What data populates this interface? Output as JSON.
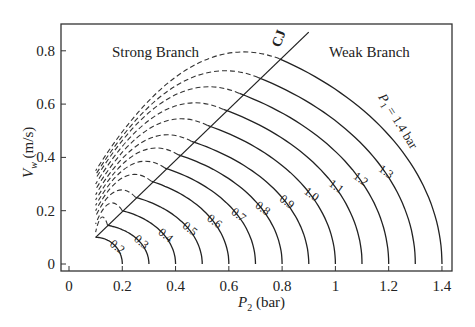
{
  "chart_data": {
    "type": "line",
    "title": "",
    "xlabel": "P2 (bar)",
    "ylabel": "Vw (m/s)",
    "xlim": [
      -0.03,
      1.47
    ],
    "ylim": [
      -0.03,
      0.9
    ],
    "xticks": [
      "0",
      "0.2",
      "0.4",
      "0.6",
      "0.8",
      "1",
      "1.2",
      "1.4"
    ],
    "yticks": [
      "0",
      "0.2",
      "0.4",
      "0.6",
      "0.8"
    ],
    "grid": false,
    "annotations": {
      "strong_branch": "Strong Branch",
      "weak_branch": "Weak Branch",
      "cj_label": "CJ",
      "p1_label": "P1 = 1.4 bar"
    },
    "cj_line": {
      "x": [
        0.1,
        0.9
      ],
      "y": [
        0.1,
        0.87
      ]
    },
    "series": [
      {
        "name": "0.2",
        "p1": 0.2,
        "cj_point": [
          0.1,
          0.1
        ],
        "left_end_y": 0.1
      },
      {
        "name": "0.3",
        "p1": 0.3,
        "cj_point": [
          0.145,
          0.145
        ],
        "left_end_y": 0.12
      },
      {
        "name": "0.4",
        "p1": 0.4,
        "cj_point": [
          0.2,
          0.2
        ],
        "left_end_y": 0.15
      },
      {
        "name": "0.5",
        "p1": 0.5,
        "cj_point": [
          0.25,
          0.25
        ],
        "left_end_y": 0.18
      },
      {
        "name": "0.6",
        "p1": 0.6,
        "cj_point": [
          0.31,
          0.31
        ],
        "left_end_y": 0.2
      },
      {
        "name": "0.7",
        "p1": 0.7,
        "cj_point": [
          0.36,
          0.36
        ],
        "left_end_y": 0.22
      },
      {
        "name": "0.8",
        "p1": 0.8,
        "cj_point": [
          0.41,
          0.41
        ],
        "left_end_y": 0.24
      },
      {
        "name": "0.9",
        "p1": 0.9,
        "cj_point": [
          0.46,
          0.46
        ],
        "left_end_y": 0.26
      },
      {
        "name": "1.0",
        "p1": 1.0,
        "cj_point": [
          0.52,
          0.52
        ],
        "left_end_y": 0.28
      },
      {
        "name": "1.1",
        "p1": 1.1,
        "cj_point": [
          0.58,
          0.58
        ],
        "left_end_y": 0.3
      },
      {
        "name": "1.2",
        "p1": 1.2,
        "cj_point": [
          0.64,
          0.64
        ],
        "left_end_y": 0.32
      },
      {
        "name": "1.3",
        "p1": 1.3,
        "cj_point": [
          0.71,
          0.7
        ],
        "left_end_y": 0.335
      },
      {
        "name": "P1 = 1.4 bar",
        "p1": 1.4,
        "cj_point": [
          0.79,
          0.77
        ],
        "left_end_y": 0.35
      }
    ]
  }
}
